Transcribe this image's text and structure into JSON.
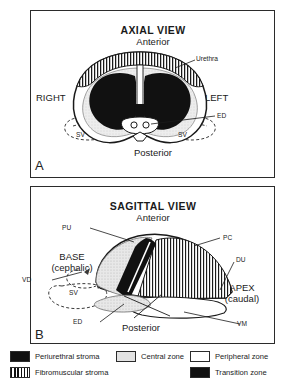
{
  "figure": {
    "panel_a": {
      "letter": "A",
      "title": "AXIAL VIEW",
      "anterior": "Anterior",
      "posterior": "Posterior",
      "right": "RIGHT",
      "left": "LEFT",
      "callouts": {
        "urethra": "Urethra",
        "ed": "ED",
        "sv_right": "SV",
        "sv_left": "SV"
      }
    },
    "panel_b": {
      "letter": "B",
      "title": "SAGITTAL VIEW",
      "anterior": "Anterior",
      "posterior": "Posterior",
      "base_line1": "BASE",
      "base_line2": "(cephalic)",
      "apex_line1": "APEX",
      "apex_line2": "(caudal)",
      "callouts": {
        "pu": "PU",
        "pc": "PC",
        "du": "DU",
        "vd": "VD",
        "sv": "SV",
        "ed": "ED",
        "vm": "VM"
      }
    },
    "legend": {
      "periurethral": "Periurethral stroma",
      "fibromuscular": "Fibromuscular stroma",
      "central": "Central zone",
      "peripheral": "Peripheral zone",
      "transition": "Transition zone"
    },
    "colors": {
      "ink": "#1a1a1a",
      "stroke": "#2b2b2b",
      "black_fill": "#111111",
      "central_gray": "#e3e3e3",
      "white_fill": "#ffffff"
    }
  }
}
